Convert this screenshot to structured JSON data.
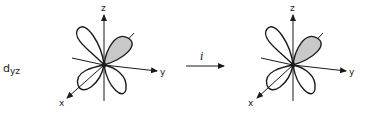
{
  "orbital_label": {
    "main": "d",
    "subscript": "yz"
  },
  "operation": {
    "symbol": "i",
    "arrow": "right-arrow"
  },
  "diagrams": [
    {
      "id": "before",
      "axes": {
        "x": "x",
        "y": "y",
        "z": "z"
      },
      "shaded_lobe": "upper-right",
      "lobe_fill": "#c8c8c8"
    },
    {
      "id": "after",
      "axes": {
        "x": "x",
        "y": "y",
        "z": "z"
      },
      "shaded_lobe": "upper-right",
      "lobe_fill": "#c8c8c8"
    }
  ],
  "colors": {
    "line": "#1a1a1a",
    "shade": "#c8c8c8",
    "background": "#ffffff"
  }
}
